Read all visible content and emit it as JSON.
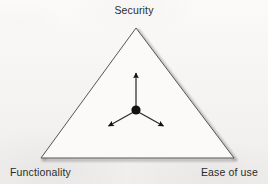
{
  "figure": {
    "type": "triangle-tradeoff-diagram",
    "background_color": "#f6f5f3",
    "outline_color": "#4a4a4a",
    "shadow_color": "#b9b9b9",
    "marker_color": "#111111",
    "text_color": "#2b2b2b",
    "vertices": {
      "top": {
        "label": "Security",
        "x": 136,
        "y": 28
      },
      "bottom_left": {
        "label": "Functionality",
        "x": 41,
        "y": 158
      },
      "bottom_right": {
        "label": "Ease of use",
        "x": 234,
        "y": 158
      }
    },
    "center_point": {
      "x": 136,
      "y": 110,
      "radius": 4.6
    },
    "arrows": [
      {
        "name": "arrow-to-security",
        "direction": "up",
        "to_x": 136,
        "to_y": 70
      },
      {
        "name": "arrow-to-functionality",
        "direction": "down-left",
        "to_x": 106,
        "to_y": 128
      },
      {
        "name": "arrow-to-ease-of-use",
        "direction": "down-right",
        "to_x": 166,
        "to_y": 128
      }
    ]
  },
  "labels": {
    "security": "Security",
    "functionality": "Functionality",
    "ease_of_use": "Ease of use"
  }
}
